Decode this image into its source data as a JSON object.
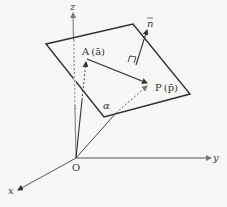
{
  "diagram": {
    "axes": {
      "x_label": "x",
      "y_label": "y",
      "z_label": "z",
      "origin_label": "O"
    },
    "plane_label": "α",
    "points": {
      "A": {
        "label": "A",
        "vector": "a",
        "vector_label": "(ā)"
      },
      "P": {
        "label": "P",
        "vector": "p",
        "vector_label": "(p̄)"
      }
    },
    "normal_vector_label": "n",
    "colors": {
      "axis": "#7a7a7a",
      "line": "#333333",
      "dashed": "#555555",
      "background": "#f7f7f6"
    }
  }
}
